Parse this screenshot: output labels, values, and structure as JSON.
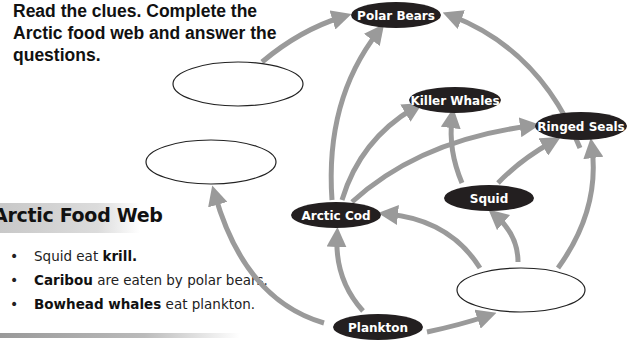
{
  "instructions": "Read the clues.  Complete the Arctic food web and answer the questions.",
  "food_web": {
    "title": "Arctic Food Web",
    "clues": [
      {
        "bold": "",
        "text_before": "Squid eat ",
        "bold_after": "krill.",
        "text_after": ""
      },
      {
        "bold": "Caribou",
        "text_before": "",
        "bold_after": "",
        "text_after": " are eaten by polar bears."
      },
      {
        "bold": "Bowhead whales",
        "text_before": "",
        "bold_after": "",
        "text_after": " eat plankton."
      }
    ],
    "nodes": {
      "polar_bears": "Polar Bears",
      "killer_whales": "Killer Whales",
      "ringed_seals": "Ringed Seals",
      "squid": "Squid",
      "arctic_cod": "Arctic Cod",
      "plankton": "Plankton"
    },
    "blank_nodes": [
      "blank-top-left",
      "blank-middle-left",
      "blank-bottom-right"
    ],
    "colors": {
      "node_fill": "#231f20",
      "arrow": "#9a9a9a",
      "text": "#111111"
    }
  }
}
